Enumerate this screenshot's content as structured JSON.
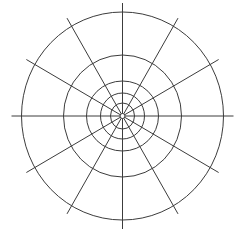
{
  "diagram": {
    "type": "polar-grid",
    "center": {
      "x": 122.5,
      "y": 116
    },
    "stroke_color": "#3c3c3c",
    "background": "#ffffff",
    "rings": [
      {
        "rx": 101,
        "ry": 104
      },
      {
        "rx": 59,
        "ry": 61
      },
      {
        "rx": 36,
        "ry": 35
      },
      {
        "rx": 22,
        "ry": 23
      },
      {
        "rx": 12,
        "ry": 13
      },
      {
        "rx": 2.5,
        "ry": 2.5
      }
    ],
    "spokes": {
      "count": 12,
      "angle_step_deg": 30,
      "inner_radius": 2.5,
      "outer_rx": 111,
      "outer_ry": 113
    }
  }
}
